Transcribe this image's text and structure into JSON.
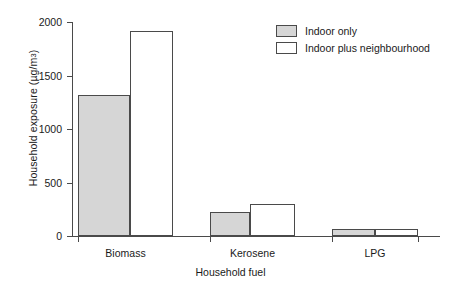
{
  "chart_data": {
    "type": "bar",
    "title": "",
    "xlabel": "Household fuel",
    "ylabel": "Household exposure (µg/m³)",
    "ylabel_prefix": "Household exposure (µg/m",
    "ylabel_exponent": "3",
    "ylabel_suffix": ")",
    "categories": [
      "Biomass",
      "Kerosene",
      "LPG"
    ],
    "series": [
      {
        "name": "Indoor only",
        "values": [
          1320,
          220,
          65
        ],
        "color": "#d6d6d6"
      },
      {
        "name": "Indoor plus neighbourhood",
        "values": [
          1920,
          295,
          65
        ],
        "color": "#ffffff"
      }
    ],
    "ylim": [
      0,
      2000
    ],
    "yticks": [
      0,
      500,
      1000,
      1500,
      2000
    ],
    "ytick_labels": [
      "0",
      "500",
      "1000",
      "1500",
      "2000"
    ],
    "grid": false,
    "legend_position": "upper right",
    "axis_color": "#4a4a4a"
  }
}
